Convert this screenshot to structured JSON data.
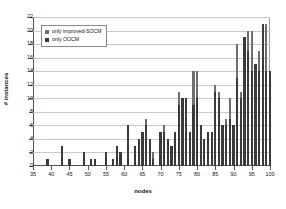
{
  "chart_data": {
    "type": "bar",
    "stacked": true,
    "title": "",
    "xlabel": "nodes",
    "ylabel": "# instances",
    "xlim": [
      35,
      100
    ],
    "ylim": [
      0,
      22
    ],
    "ytick_step": 2,
    "xtick_step": 5,
    "grid": true,
    "legend_position": "top-left",
    "yticks": [
      0,
      2,
      4,
      6,
      8,
      10,
      12,
      14,
      16,
      18,
      20,
      22
    ],
    "xticks": [
      35,
      40,
      45,
      50,
      55,
      60,
      65,
      70,
      75,
      80,
      85,
      90,
      95,
      100
    ],
    "colors": {
      "only_improved_socm": "#6e6e6e",
      "only_oocm": "#3a3a3a",
      "grid": "#c9c9c9",
      "axis": "#555555"
    },
    "categories": [
      35,
      36,
      37,
      38,
      39,
      40,
      41,
      42,
      43,
      44,
      45,
      46,
      47,
      48,
      49,
      50,
      51,
      52,
      53,
      54,
      55,
      56,
      57,
      58,
      59,
      60,
      61,
      62,
      63,
      64,
      65,
      66,
      67,
      68,
      69,
      70,
      71,
      72,
      73,
      74,
      75,
      76,
      77,
      78,
      79,
      80,
      81,
      82,
      83,
      84,
      85,
      86,
      87,
      88,
      89,
      90,
      91,
      92,
      93,
      94,
      95,
      96,
      97,
      98,
      99,
      100
    ],
    "series": [
      {
        "name": "only OOCM",
        "values": [
          0,
          0,
          0,
          0,
          1,
          0,
          0,
          0,
          3,
          0,
          1,
          0,
          0,
          0,
          2,
          0,
          1,
          1,
          0,
          0,
          2,
          0,
          1,
          3,
          2,
          0,
          6,
          0,
          3,
          4,
          5,
          6,
          4,
          1,
          0,
          5,
          5,
          4,
          3,
          5,
          9,
          10,
          10,
          5,
          9,
          10,
          6,
          4,
          5,
          5,
          11,
          10,
          6,
          6,
          7,
          6,
          13,
          10,
          19,
          17,
          14,
          15,
          14,
          21,
          14,
          14
        ]
      },
      {
        "name": "only improved-SOCM",
        "values": [
          0,
          0,
          0,
          0,
          0,
          0,
          0,
          0,
          0,
          0,
          0,
          0,
          0,
          0,
          0,
          0,
          0,
          0,
          0,
          0,
          0,
          0,
          0,
          0,
          0,
          0,
          0,
          0,
          0,
          0,
          0,
          1,
          0,
          1,
          0,
          0,
          1,
          0,
          0,
          0,
          2,
          0,
          0,
          0,
          5,
          4,
          0,
          0,
          0,
          0,
          1,
          1,
          0,
          1,
          3,
          0,
          5,
          1,
          0,
          3,
          6,
          0,
          3,
          0,
          7,
          0
        ]
      }
    ],
    "legend": [
      {
        "label": "only improved-SOCM",
        "color": "#6e6e6e"
      },
      {
        "label": "only OOCM",
        "color": "#3a3a3a"
      }
    ]
  }
}
